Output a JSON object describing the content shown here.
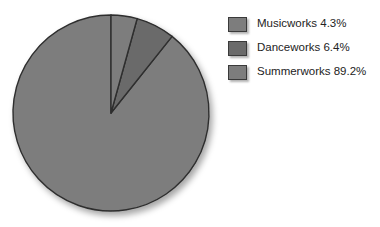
{
  "chart_data": {
    "type": "pie",
    "title": "",
    "subtitle": "",
    "xlabel": "",
    "ylabel": "",
    "grid": false,
    "legend_position": "right",
    "start_angle_deg": 0,
    "direction": "clockwise",
    "categories": [
      "Musicworks",
      "Danceworks",
      "Summerworks"
    ],
    "values": [
      4.3,
      6.4,
      89.2
    ],
    "value_unit": "%",
    "slices": [
      {
        "label": "Musicworks",
        "value": 4.3,
        "display": "Musicworks 4.3%",
        "color": "#7d7d7d",
        "angle_deg": 15.5
      },
      {
        "label": "Danceworks",
        "value": 6.4,
        "display": "Danceworks 6.4%",
        "color": "#6a6a6a",
        "angle_deg": 23.0
      },
      {
        "label": "Summerworks",
        "value": 89.2,
        "display": "Summerworks 89.2%",
        "color": "#7d7d7d",
        "angle_deg": 321.1
      }
    ]
  },
  "legend": {
    "items": [
      {
        "label": "Musicworks 4.3%",
        "swatch_color": "#7d7d7d"
      },
      {
        "label": "Danceworks 6.4%",
        "swatch_color": "#6a6a6a"
      },
      {
        "label": "Summerworks 89.2%",
        "swatch_color": "#7d7d7d"
      }
    ]
  },
  "style": {
    "background": "#ffffff",
    "slice_outline": "#2e2e2e",
    "text_color": "#232323"
  }
}
